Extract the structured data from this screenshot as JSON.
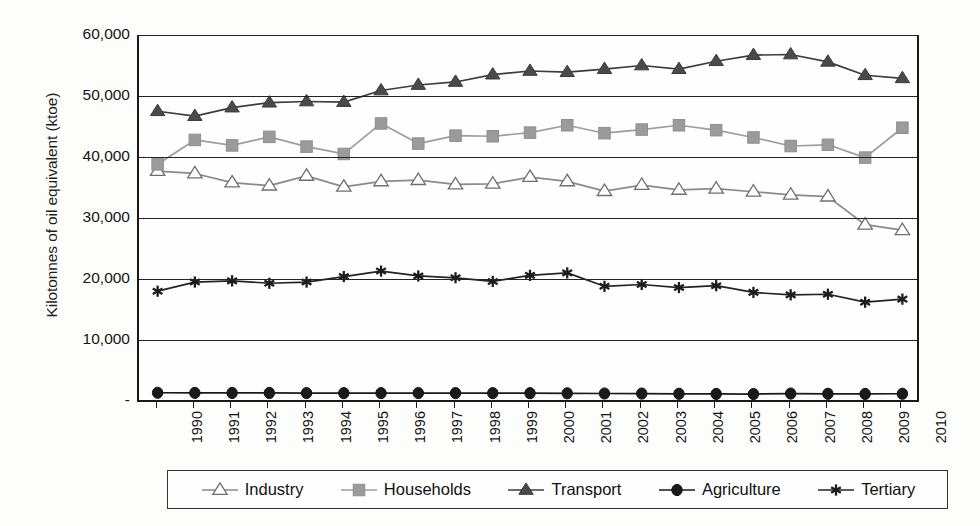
{
  "chart_data": {
    "type": "line",
    "title": "",
    "xlabel": "",
    "ylabel": "Kilotonnes of oil equivalent (ktoe)",
    "grid": true,
    "legend_position": "bottom",
    "ylim": [
      0,
      60000
    ],
    "yticks": [
      "-",
      "10,000",
      "20,000",
      "30,000",
      "40,000",
      "50,000",
      "60,000"
    ],
    "ytick_values": [
      0,
      10000,
      20000,
      30000,
      40000,
      50000,
      60000
    ],
    "categories": [
      "1990",
      "1991",
      "1992",
      "1993",
      "1994",
      "1995",
      "1996",
      "1997",
      "1998",
      "1999",
      "2000",
      "2001",
      "2002",
      "2003",
      "2004",
      "2005",
      "2006",
      "2007",
      "2008",
      "2009",
      "2010"
    ],
    "series": [
      {
        "name": "Industry",
        "marker": "open-triangle",
        "color": "#8a8a8a",
        "marker_fill": "#ffffff",
        "marker_stroke": "#6f6f6f",
        "values": [
          37700,
          37300,
          35800,
          35300,
          36900,
          35100,
          36000,
          36200,
          35500,
          35600,
          36700,
          36000,
          34400,
          35400,
          34600,
          34800,
          34300,
          33800,
          33500,
          28900,
          28000
        ]
      },
      {
        "name": "Households",
        "marker": "filled-square",
        "color": "#9d9d9d",
        "marker_fill": "#9b9b9b",
        "marker_stroke": "#8e8e8e",
        "values": [
          38800,
          42800,
          41900,
          43300,
          41700,
          40500,
          45500,
          42200,
          43500,
          43400,
          44000,
          45200,
          43900,
          44500,
          45200,
          44400,
          43200,
          41800,
          42000,
          39900,
          44800
        ]
      },
      {
        "name": "Transport",
        "marker": "filled-triangle",
        "color": "#3d3d3d",
        "marker_fill": "#4a4a4a",
        "marker_stroke": "#3a3a3a",
        "values": [
          47500,
          46700,
          48100,
          48900,
          49100,
          49000,
          50900,
          51800,
          52300,
          53500,
          54100,
          53900,
          54400,
          55000,
          54400,
          55700,
          56700,
          56800,
          55600,
          53400,
          52900
        ]
      },
      {
        "name": "Agriculture",
        "marker": "filled-circle",
        "color": "#1a1a1a",
        "marker_fill": "#1a1a1a",
        "marker_stroke": "#111111",
        "values": [
          1350,
          1330,
          1320,
          1320,
          1300,
          1290,
          1290,
          1300,
          1290,
          1290,
          1280,
          1260,
          1230,
          1220,
          1180,
          1160,
          1140,
          1220,
          1180,
          1160,
          1190
        ]
      },
      {
        "name": "Tertiary",
        "marker": "asterisk",
        "color": "#242424",
        "marker_fill": "#242424",
        "marker_stroke": "#1c1c1c",
        "values": [
          18000,
          19500,
          19700,
          19300,
          19500,
          20400,
          21300,
          20500,
          20200,
          19600,
          20600,
          21000,
          18800,
          19100,
          18600,
          18900,
          17800,
          17400,
          17500,
          16200,
          16700
        ]
      }
    ]
  }
}
